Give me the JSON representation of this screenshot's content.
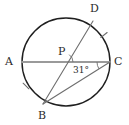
{
  "figure": {
    "kind": "circle-geometry-diagram",
    "background_color": "#ffffff",
    "circle": {
      "name": "circle",
      "center_x": 66,
      "center_y": 62,
      "radius": 44,
      "stroke_color": "#1f1f1f",
      "stroke_width": 1.4
    },
    "points": [
      {
        "id": "A",
        "label": "A",
        "x": 22,
        "y": 62,
        "label_x": 5,
        "label_y": 56
      },
      {
        "id": "B",
        "label": "B",
        "x": 43,
        "y": 104,
        "label_x": 38,
        "label_y": 110
      },
      {
        "id": "C",
        "label": "C",
        "x": 110,
        "y": 62,
        "label_x": 114,
        "label_y": 56
      },
      {
        "id": "D",
        "label": "D",
        "x": 93,
        "y": 21,
        "label_x": 90,
        "label_y": 3
      },
      {
        "id": "P",
        "label": "P",
        "x": 64,
        "y": 62,
        "label_x": 58,
        "label_y": 46
      }
    ],
    "chords": [
      {
        "name": "chord-AC",
        "from": "A",
        "to": "C",
        "stroke_color": "#9a9a9a",
        "stroke_width": 2.0
      },
      {
        "name": "chord-BD",
        "from": "B",
        "to": "D",
        "stroke_color": "#6e6e6e",
        "stroke_width": 1.1
      },
      {
        "name": "chord-BC",
        "from": "B",
        "to": "C",
        "stroke_color": "#6e6e6e",
        "stroke_width": 1.1
      }
    ],
    "angles": [
      {
        "name": "angle-at-C",
        "vertex": "C",
        "label": "31°",
        "value": 31,
        "unit": "degrees",
        "label_x": 73,
        "label_y": 66,
        "arc_color": "#6e6e6e"
      },
      {
        "name": "angle-at-P",
        "vertex": "P",
        "label": "",
        "arc_color": "#6e6e6e"
      }
    ],
    "arc_tick_marks": [
      {
        "name": "arc-tick-DC",
        "x": 104,
        "y": 35,
        "rotation": -38,
        "stroke_color": "#6e6e6e"
      },
      {
        "name": "arc-tick-AB",
        "x": 26,
        "y": 86,
        "rotation": 44,
        "stroke_color": "#6e6e6e"
      }
    ]
  }
}
